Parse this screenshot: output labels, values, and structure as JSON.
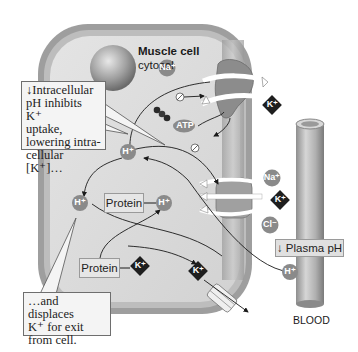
{
  "diagram": {
    "cell": {
      "title": "Muscle cell",
      "subtitle": "cytosol"
    },
    "callouts": {
      "top_left": {
        "arrow_glyph": "↓",
        "lines": [
          "Intracellular",
          "pH inhibits K⁺",
          "uptake,",
          "lowering intra-",
          "cellular [K⁺]…"
        ]
      },
      "bottom_left": {
        "lines": [
          "…and displaces",
          "K⁺ for exit",
          "from cell."
        ]
      }
    },
    "labels": {
      "plasma_ph": "↓ Plasma pH",
      "blood": "BLOOD",
      "protein_h": "Protein",
      "protein_k": "Protein"
    },
    "ions": {
      "na_top": "Na⁺",
      "k_top": "K⁺",
      "atp": "ATP",
      "h_upper": "H⁺",
      "h_left": "H⁺",
      "h_protein": "H⁺",
      "na_cotransport": "Na⁺",
      "k_cotransport": "K⁺",
      "cl_cotransport": "Cl⁻",
      "k_protein": "K⁺",
      "k_exit": "K⁺",
      "h_blood": "H⁺"
    },
    "colors": {
      "membrane_outer": "#a9a9a9",
      "membrane_inner": "#c4c4c4",
      "cytosol": "#dcdcdc",
      "ion_circle": "#8a8a8a",
      "k_diamond": "#1e1e1e",
      "callout_bg": "#f4f4f4",
      "blood_vessel": "#b8b8b8"
    }
  }
}
